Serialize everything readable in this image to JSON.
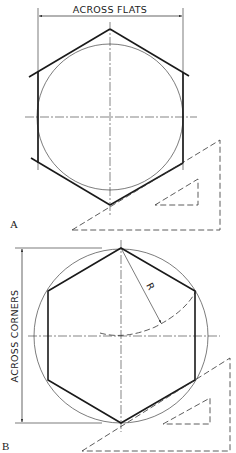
{
  "figures": [
    {
      "id": "A",
      "label": "A",
      "dimension_label": "ACROSS FLATS",
      "description": "Hexagon circumscribed about a circle, drawn with 30-60 set square"
    },
    {
      "id": "B",
      "label": "B",
      "dimension_label": "ACROSS CORNERS",
      "radius_label": "R",
      "description": "Hexagon inscribed in a circle, drawn with 30-60 set square"
    }
  ],
  "colors": {
    "line": "#1a1a1a",
    "background": "#ffffff"
  }
}
